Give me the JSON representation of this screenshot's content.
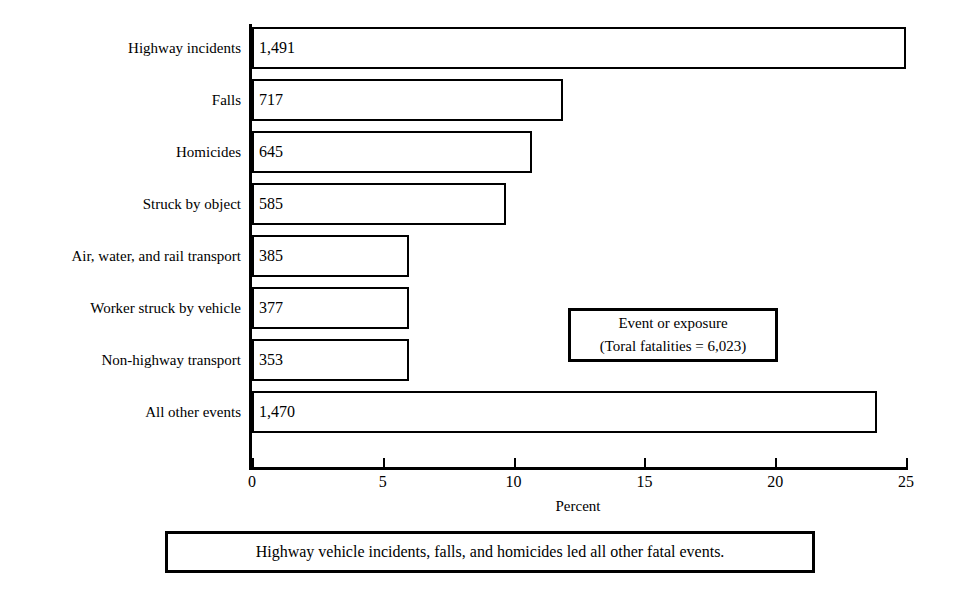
{
  "chart_data": {
    "type": "bar",
    "orientation": "horizontal",
    "title": "",
    "xlabel": "Percent",
    "ylabel": "",
    "xlim": [
      0,
      25
    ],
    "xticks": [
      0,
      5,
      10,
      15,
      20,
      25
    ],
    "xtick_labels": [
      "0",
      "5",
      "10",
      "15",
      "20",
      "25"
    ],
    "grid": false,
    "legend_position": "inside-right",
    "categories": [
      "Highway incidents",
      "Falls",
      "Homicides",
      "Struck by object",
      "Air, water, and rail transport",
      "Worker struck by vehicle",
      "Non-highway transport",
      "All other events"
    ],
    "values": [
      25.0,
      11.9,
      10.7,
      9.7,
      6.0,
      6.0,
      6.0,
      23.9
    ],
    "data_labels": [
      "1,491",
      "717",
      "645",
      "585",
      "385",
      "377",
      "353",
      "1,470"
    ],
    "counts": [
      1491,
      717,
      645,
      585,
      385,
      377,
      353,
      1470
    ],
    "annotations": [
      "Event or exposure",
      "(Toral fatalities = 6,023)",
      "Highway vehicle incidents, falls, and homicides led all other fatal events."
    ],
    "colors": {
      "bar_fill": "#ffffff",
      "bar_stroke": "#000000",
      "axis": "#000000",
      "background": "#ffffff",
      "text": "#000000"
    }
  },
  "legend": {
    "line1": "Event or exposure",
    "line2": "(Toral fatalities = 6,023)"
  },
  "caption": {
    "text": "Highway vehicle incidents, falls, and homicides led all other fatal events."
  },
  "axis": {
    "x_title": "Percent"
  }
}
